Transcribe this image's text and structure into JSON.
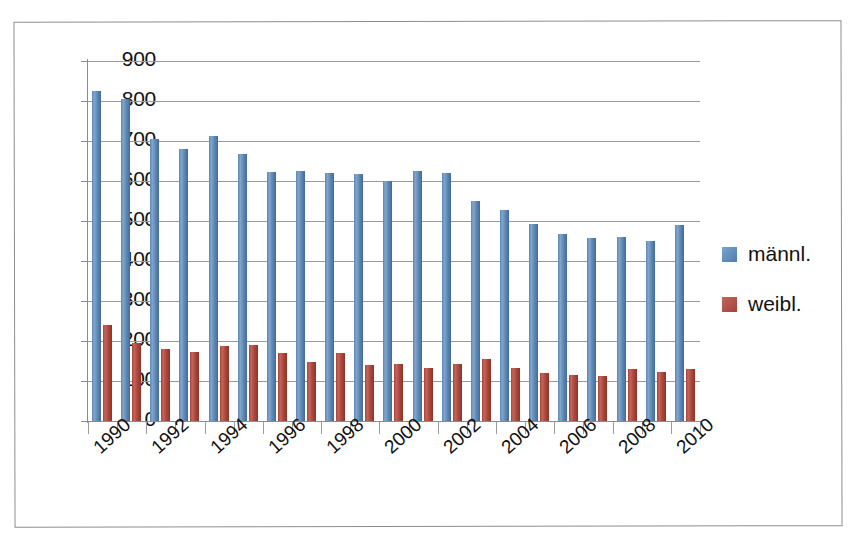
{
  "chart_data": {
    "type": "bar",
    "title": "",
    "subtitle": "",
    "xlabel": "",
    "ylabel": "",
    "ylim": [
      0,
      900
    ],
    "ytick_step": 100,
    "yticks": [
      0,
      100,
      200,
      300,
      400,
      500,
      600,
      700,
      800,
      900
    ],
    "ytick_labels": [
      "0",
      "100",
      "200",
      "300",
      "400",
      "500",
      "600",
      "700",
      "800",
      "900"
    ],
    "grid": true,
    "grid_axis": "y",
    "legend_position": "right",
    "x_tick_label_rotation": -42,
    "categories": [
      "1990",
      "1991",
      "1992",
      "1993",
      "1994",
      "1995",
      "1996",
      "1997",
      "1998",
      "1999",
      "2000",
      "2001",
      "2002",
      "2003",
      "2004",
      "2005",
      "2006",
      "2007",
      "2008",
      "2009",
      "2010"
    ],
    "visible_tick_labels": [
      "1990",
      "1992",
      "1994",
      "1996",
      "1998",
      "2000",
      "2002",
      "2004",
      "2006",
      "2008",
      "2010"
    ],
    "series": [
      {
        "name": "männl.",
        "color": "#5b85b3",
        "values": [
          825,
          805,
          705,
          680,
          713,
          667,
          622,
          625,
          620,
          618,
          600,
          625,
          620,
          550,
          528,
          492,
          468,
          458,
          460,
          450,
          490
        ]
      },
      {
        "name": "weibl.",
        "color": "#ab473c",
        "values": [
          240,
          195,
          180,
          172,
          188,
          190,
          170,
          148,
          170,
          140,
          142,
          133,
          143,
          155,
          132,
          120,
          115,
          112,
          130,
          123,
          131
        ]
      }
    ]
  },
  "legend": {
    "items": [
      {
        "label": "männl.",
        "color": "#5b85b3"
      },
      {
        "label": "weibl.",
        "color": "#ab473c"
      }
    ]
  },
  "colors": {
    "male": "#5b85b3",
    "female": "#ab473c",
    "gridline": "#9a9a9a",
    "axis": "#8c8c8c",
    "text": "#111111",
    "frame": "#8d8d8d",
    "background": "#ffffff"
  }
}
